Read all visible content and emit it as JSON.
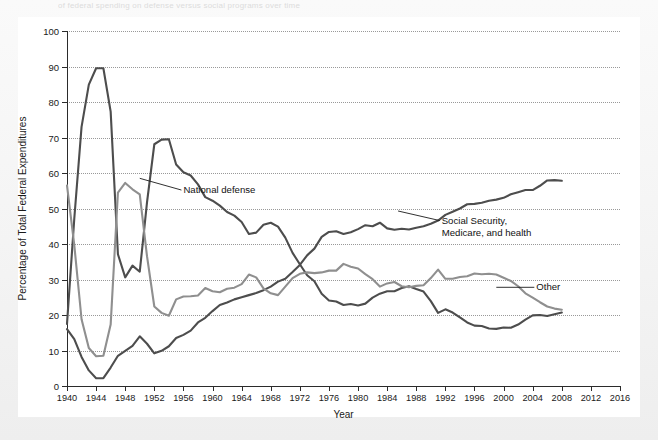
{
  "page": {
    "caption_faint": "of federal spending on defense versus social programs over time"
  },
  "chart_data": {
    "type": "line",
    "title": "",
    "xlabel": "Year",
    "ylabel": "Percentage of Total Federal Expenditures",
    "xlim": [
      1940,
      2016
    ],
    "ylim": [
      0,
      100
    ],
    "grid": "horizontal-dotted",
    "legend_position": "inline-annotations",
    "ytick_labels": [
      "0",
      "10",
      "20",
      "30",
      "40",
      "50",
      "60",
      "70",
      "80",
      "90",
      "100"
    ],
    "ytick_values": [
      0,
      10,
      20,
      30,
      40,
      50,
      60,
      70,
      80,
      90,
      100
    ],
    "xtick_labels": [
      "1940",
      "1944",
      "1948",
      "1952",
      "1956",
      "1960",
      "1964",
      "1968",
      "1972",
      "1976",
      "1980",
      "1984",
      "1988",
      "1992",
      "1996",
      "2000",
      "2004",
      "2008",
      "2012",
      "2016"
    ],
    "xtick_values": [
      1940,
      1944,
      1948,
      1952,
      1956,
      1960,
      1964,
      1968,
      1972,
      1976,
      1980,
      1984,
      1988,
      1992,
      1996,
      2000,
      2004,
      2008,
      2012,
      2016
    ],
    "series": [
      {
        "name": "National defense",
        "color": "#4d4d4d",
        "width": 2.1,
        "annotation": "National defense",
        "x": [
          1940,
          1941,
          1942,
          1943,
          1944,
          1945,
          1946,
          1947,
          1948,
          1949,
          1950,
          1951,
          1952,
          1953,
          1954,
          1955,
          1956,
          1957,
          1958,
          1959,
          1960,
          1961,
          1962,
          1963,
          1964,
          1965,
          1966,
          1967,
          1968,
          1969,
          1970,
          1971,
          1972,
          1973,
          1974,
          1975,
          1976,
          1977,
          1978,
          1979,
          1980,
          1981,
          1982,
          1983,
          1984,
          1985,
          1986,
          1987,
          1988,
          1989,
          1990,
          1991,
          1992,
          1993,
          1994,
          1995,
          1996,
          1997,
          1998,
          1999,
          2000,
          2001,
          2002,
          2003,
          2004,
          2005,
          2006,
          2007,
          2008
        ],
        "y": [
          17.5,
          47.1,
          73.0,
          84.9,
          89.5,
          89.5,
          77.3,
          37.1,
          30.6,
          33.9,
          32.2,
          51.8,
          68.1,
          69.4,
          69.5,
          62.4,
          60.2,
          59.3,
          56.8,
          53.2,
          52.2,
          50.8,
          49.0,
          48.0,
          46.2,
          42.8,
          43.2,
          45.4,
          46.0,
          44.9,
          41.8,
          37.5,
          34.3,
          31.2,
          29.5,
          26.0,
          24.1,
          23.8,
          22.8,
          23.1,
          22.7,
          23.2,
          24.9,
          26.0,
          26.7,
          26.7,
          27.6,
          28.1,
          27.3,
          26.6,
          23.9,
          20.6,
          21.6,
          20.7,
          19.3,
          17.9,
          17.0,
          16.9,
          16.2,
          16.1,
          16.5,
          16.4,
          17.3,
          18.7,
          19.9,
          20.0,
          19.7,
          20.2,
          20.7
        ]
      },
      {
        "name": "Social Security, Medicare, and health",
        "color": "#4d4d4d",
        "width": 2.1,
        "annotation": "Social Security,\nMedicare, and health",
        "x": [
          1940,
          1941,
          1942,
          1943,
          1944,
          1945,
          1946,
          1947,
          1948,
          1949,
          1950,
          1951,
          1952,
          1953,
          1954,
          1955,
          1956,
          1957,
          1958,
          1959,
          1960,
          1961,
          1962,
          1963,
          1964,
          1965,
          1966,
          1967,
          1968,
          1969,
          1970,
          1971,
          1972,
          1973,
          1974,
          1975,
          1976,
          1977,
          1978,
          1979,
          1980,
          1981,
          1982,
          1983,
          1984,
          1985,
          1986,
          1987,
          1988,
          1989,
          1990,
          1991,
          1992,
          1993,
          1994,
          1995,
          1996,
          1997,
          1998,
          1999,
          2000,
          2001,
          2002,
          2003,
          2004,
          2005,
          2006,
          2007,
          2008
        ],
        "y": [
          16.0,
          13.2,
          8.2,
          4.4,
          2.2,
          2.2,
          5.2,
          8.5,
          9.9,
          11.3,
          14.0,
          11.9,
          9.2,
          9.9,
          11.2,
          13.5,
          14.4,
          15.6,
          17.9,
          19.2,
          21.1,
          22.8,
          23.5,
          24.4,
          25.0,
          25.6,
          26.2,
          27.0,
          28.0,
          29.4,
          30.2,
          32.1,
          34.1,
          36.8,
          38.7,
          42.0,
          43.4,
          43.6,
          42.8,
          43.3,
          44.2,
          45.3,
          45.0,
          46.0,
          44.4,
          44.0,
          44.3,
          44.1,
          44.6,
          45.0,
          45.7,
          46.6,
          48.2,
          49.1,
          50.0,
          51.2,
          51.3,
          51.6,
          52.2,
          52.5,
          53.0,
          54.0,
          54.6,
          55.2,
          55.2,
          56.4,
          57.9,
          58.0,
          57.8
        ]
      },
      {
        "name": "Other",
        "color": "#8f8f8f",
        "width": 2.1,
        "annotation": "Other",
        "x": [
          1940,
          1941,
          1942,
          1943,
          1944,
          1945,
          1946,
          1947,
          1948,
          1949,
          1950,
          1951,
          1952,
          1953,
          1954,
          1955,
          1956,
          1957,
          1958,
          1959,
          1960,
          1961,
          1962,
          1963,
          1964,
          1965,
          1966,
          1967,
          1968,
          1969,
          1970,
          1971,
          1972,
          1973,
          1974,
          1975,
          1976,
          1977,
          1978,
          1979,
          1980,
          1981,
          1982,
          1983,
          1984,
          1985,
          1986,
          1987,
          1988,
          1989,
          1990,
          1991,
          1992,
          1993,
          1994,
          1995,
          1996,
          1997,
          1998,
          1999,
          2000,
          2001,
          2002,
          2003,
          2004,
          2005,
          2006,
          2007,
          2008
        ],
        "y": [
          56.5,
          39.7,
          18.8,
          10.7,
          8.4,
          8.5,
          17.3,
          54.5,
          57.2,
          55.4,
          54.0,
          36.5,
          22.4,
          20.6,
          19.8,
          24.4,
          25.2,
          25.3,
          25.5,
          27.6,
          26.7,
          26.4,
          27.4,
          27.7,
          28.7,
          31.4,
          30.6,
          27.5,
          26.1,
          25.6,
          28.0,
          30.4,
          31.6,
          32.0,
          31.8,
          32.0,
          32.5,
          32.5,
          34.4,
          33.6,
          33.1,
          31.5,
          30.1,
          28.0,
          28.9,
          29.3,
          28.1,
          27.8,
          28.2,
          28.4,
          30.4,
          32.8,
          30.2,
          30.2,
          30.7,
          30.9,
          31.7,
          31.5,
          31.6,
          31.4,
          30.5,
          29.6,
          28.1,
          26.1,
          24.9,
          23.6,
          22.4,
          21.8,
          21.5
        ]
      }
    ],
    "annotations": [
      {
        "text": "National defense",
        "x": 1957,
        "y": 55
      },
      {
        "text": "Social Security, Medicare, and health",
        "x": 1990,
        "y": 47
      },
      {
        "text": "Other",
        "x": 2003,
        "y": 28
      }
    ]
  }
}
